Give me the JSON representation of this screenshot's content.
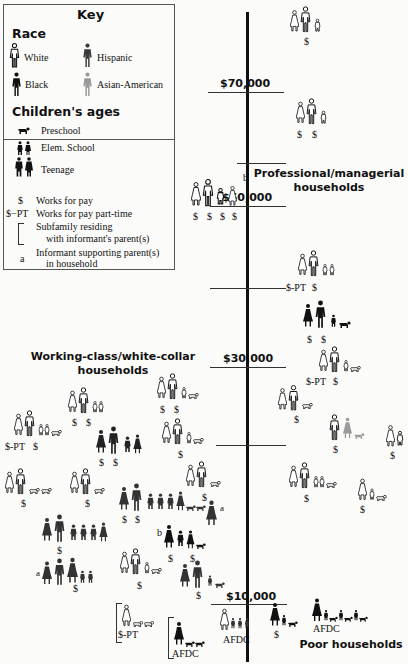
{
  "key": {
    "title": "Key",
    "race_heading": "Race",
    "race": [
      {
        "label": "White",
        "color": "#ffffff"
      },
      {
        "label": "Hispanic",
        "color": "#3a3a3a"
      },
      {
        "label": "Black",
        "color": "#111111"
      },
      {
        "label": "Asian-American",
        "color": "#9a9a9a"
      }
    ],
    "ages_heading": "Children's ages",
    "ages": [
      {
        "label": "Preschool"
      },
      {
        "label": "Elem. School"
      },
      {
        "label": "Teenage"
      }
    ],
    "symbols": [
      {
        "symbol": "$",
        "label": "Works for pay"
      },
      {
        "symbol": "$−PT",
        "label": "Works for pay part-time"
      },
      {
        "symbol": "[",
        "label": "Subfamily residing",
        "label2": "with informant's parent(s)"
      },
      {
        "symbol": "a",
        "label": "Informant supporting parent(s)",
        "label2": "in household"
      },
      {
        "symbol": "b",
        "label": "Informant's children contribute",
        "label2": "to household income"
      }
    ]
  },
  "axis": {
    "ticks": [
      {
        "label": "$70,000",
        "y": 92,
        "x1": 208,
        "x2": 283
      },
      {
        "label": "",
        "y": 163,
        "x1": 237,
        "x2": 286
      },
      {
        "label": "$50,000",
        "y": 206,
        "x1": 210,
        "x2": 286
      },
      {
        "label": "",
        "y": 288,
        "x1": 210,
        "x2": 286
      },
      {
        "label": "$30,000",
        "y": 367,
        "x1": 210,
        "x2": 286
      },
      {
        "label": "",
        "y": 445,
        "x1": 216,
        "x2": 286
      },
      {
        "label": "$10,000",
        "y": 604,
        "x1": 211,
        "x2": 287
      }
    ]
  },
  "sections": {
    "professional": [
      "Professional/managerial",
      "households"
    ],
    "working": [
      "Working-class/white-collar",
      "households"
    ],
    "poor": "Poor households"
  },
  "labels": {
    "works": "$",
    "pt": "$-PT",
    "afdc": "AFDC",
    "a": "a",
    "b": "b"
  }
}
